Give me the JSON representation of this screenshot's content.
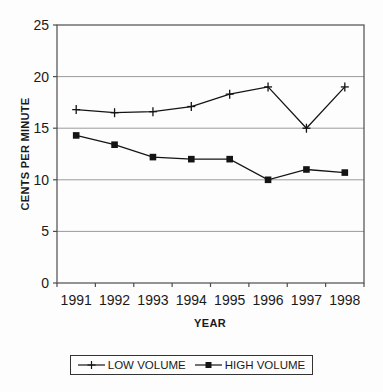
{
  "chart_data": {
    "type": "line",
    "title": "",
    "xlabel": "YEAR",
    "ylabel": "CENTS PER MINUTE",
    "categories": [
      "1991",
      "1992",
      "1993",
      "1994",
      "1995",
      "1996",
      "1997",
      "1998"
    ],
    "series": [
      {
        "name": "LOW VOLUME",
        "marker": "plus",
        "color": "#141414",
        "values": [
          16.8,
          16.5,
          16.6,
          17.1,
          18.3,
          19.0,
          15.0,
          19.0
        ]
      },
      {
        "name": "HIGH VOLUME",
        "marker": "square",
        "color": "#141414",
        "values": [
          14.3,
          13.4,
          12.2,
          12.0,
          12.0,
          10.0,
          11.0,
          10.7
        ]
      }
    ],
    "ylim": [
      0,
      25
    ],
    "yticks": [
      0,
      5,
      10,
      15,
      20,
      25
    ],
    "grid": true,
    "legend_position": "bottom",
    "colors": {
      "line": "#141414",
      "grid": "#9a9a9a",
      "frame": "#4d4d4d",
      "text": "#1a1a1a",
      "background": "#fdfdfd"
    }
  }
}
